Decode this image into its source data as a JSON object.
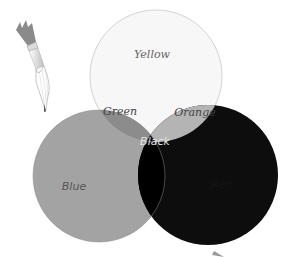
{
  "diagram": {
    "type": "venn-color-mixing",
    "circles": [
      {
        "id": "yellow",
        "label": "Yellow",
        "fill": "#f7f7f7",
        "stroke": "#c9c9c9"
      },
      {
        "id": "blue",
        "label": "Blue",
        "fill": "#a3a3a3"
      },
      {
        "id": "red",
        "label": "Red",
        "fill": "#0d0d0d"
      }
    ],
    "overlaps": [
      {
        "id": "green",
        "label": "Green",
        "between": [
          "yellow",
          "blue"
        ],
        "fill": "#8c8c8c"
      },
      {
        "id": "orange",
        "label": "Orange",
        "between": [
          "yellow",
          "red"
        ],
        "fill": "#b4b4b4"
      },
      {
        "id": "black",
        "label": "Black",
        "between": [
          "blue",
          "red"
        ],
        "fill": "#000000"
      }
    ],
    "decoration": {
      "paintbrush_icon": "paintbrush-icon"
    },
    "colors": {
      "yellow_text": "#666666",
      "green_text": "#444444",
      "orange_text": "#444444",
      "blue_text": "#555555",
      "black_text": "#e6e6e6"
    }
  }
}
